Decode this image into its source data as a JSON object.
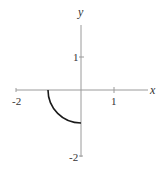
{
  "chart_data": {
    "type": "line",
    "title": "",
    "xlabel": "x",
    "ylabel": "y",
    "xlim": [
      -2,
      1.35
    ],
    "ylim": [
      -2,
      2
    ],
    "x_ticks": [
      -2,
      1
    ],
    "y_ticks": [
      1,
      -2
    ],
    "x_tick_labels": [
      "-2",
      "1"
    ],
    "y_tick_labels": [
      "1",
      "-2"
    ],
    "grid": false,
    "legend": null,
    "series": [
      {
        "name": "quarter circle",
        "description": "Lower-left quarter of unit circle from (-1, 0) to (0, -1)",
        "x": [
          -1.0,
          -0.966,
          -0.866,
          -0.707,
          -0.5,
          -0.259,
          0.0
        ],
        "y": [
          0.0,
          -0.259,
          -0.5,
          -0.707,
          -0.866,
          -0.966,
          -1.0
        ]
      }
    ],
    "colors": {
      "axes": "#999999",
      "curve": "#1a1a1a",
      "text": "#333333"
    }
  },
  "layout": {
    "origin_px": [
      81,
      90
    ],
    "unit_px": 33
  }
}
